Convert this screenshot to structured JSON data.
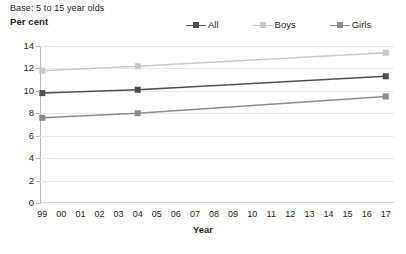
{
  "header": {
    "base_note": "Base: 5 to 15 year olds",
    "y_axis_title": "Per cent"
  },
  "legend": {
    "position": "top-right",
    "items": [
      {
        "label": "All",
        "color": "#4d4d4d",
        "marker": "square"
      },
      {
        "label": "Boys",
        "color": "#c9c9c9",
        "marker": "square"
      },
      {
        "label": "Girls",
        "color": "#8c8c8c",
        "marker": "square"
      }
    ]
  },
  "axes": {
    "x_title": "Year",
    "y_ticks": [
      "14",
      "12",
      "10",
      "8",
      "6",
      "4",
      "2",
      "0"
    ],
    "x_ticks": [
      "99",
      "00",
      "01",
      "02",
      "03",
      "04",
      "05",
      "06",
      "07",
      "08",
      "09",
      "10",
      "11",
      "12",
      "13",
      "14",
      "15",
      "16",
      "17"
    ]
  },
  "chart_data": {
    "type": "line",
    "title": "",
    "subtitle": "Base: 5 to 15 year olds",
    "xlabel": "Year",
    "ylabel": "Per cent",
    "ylim": [
      0,
      14
    ],
    "ytick_step": 2,
    "grid": true,
    "legend_position": "top-right",
    "x": [
      "99",
      "00",
      "01",
      "02",
      "03",
      "04",
      "05",
      "06",
      "07",
      "08",
      "09",
      "10",
      "11",
      "12",
      "13",
      "14",
      "15",
      "16",
      "17"
    ],
    "marker_x": [
      "99",
      "04",
      "17"
    ],
    "series": [
      {
        "name": "All",
        "color": "#4d4d4d",
        "points": [
          {
            "x": "99",
            "y": 9.8
          },
          {
            "x": "04",
            "y": 10.1
          },
          {
            "x": "17",
            "y": 11.3
          }
        ]
      },
      {
        "name": "Boys",
        "color": "#c9c9c9",
        "points": [
          {
            "x": "99",
            "y": 11.8
          },
          {
            "x": "04",
            "y": 12.2
          },
          {
            "x": "17",
            "y": 13.4
          }
        ]
      },
      {
        "name": "Girls",
        "color": "#8c8c8c",
        "points": [
          {
            "x": "99",
            "y": 7.6
          },
          {
            "x": "04",
            "y": 8.0
          },
          {
            "x": "17",
            "y": 9.5
          }
        ]
      }
    ]
  }
}
